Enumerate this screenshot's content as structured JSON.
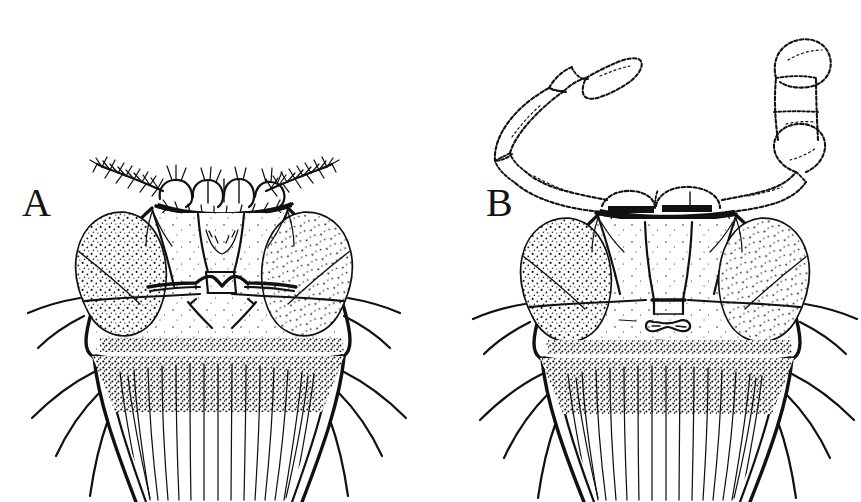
{
  "figure": {
    "background_color": "#ffffff",
    "ink_color": "#111111",
    "width": 861,
    "height": 502,
    "kind": "scientific-line-drawing"
  },
  "panels": [
    {
      "id": "A",
      "label": "A",
      "label_x": 22,
      "label_y": 216,
      "center_x": 215,
      "description": "head in frontal view with plumose (feathery) antennal aristae",
      "features": {
        "antenna_type": "plumose-arista",
        "eyes": "large stippled compound eyes",
        "clypeus": "broad trapezoid",
        "proboscis": "hairy, radiating setae"
      }
    },
    {
      "id": "B",
      "label": "B",
      "label_x": 486,
      "label_y": 216,
      "center_x": 665,
      "description": "head in frontal view with long segmented club-shaped antennae",
      "features": {
        "antenna_type": "elongate-segmented-clubbed",
        "eyes": "large stippled compound eyes",
        "clypeus": "narrow elongate",
        "proboscis": "hairy, radiating setae"
      }
    }
  ],
  "caption": {
    "visible": false,
    "text": ""
  }
}
